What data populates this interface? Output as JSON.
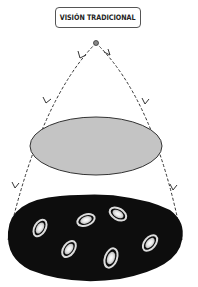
{
  "title": "VISIÓN TRADICIONAL",
  "diagram": {
    "apex_point": {
      "x": 96,
      "y": 43
    },
    "upper_ellipse": {
      "cx": 96,
      "cy": 146,
      "rx": 66,
      "ry": 29,
      "fill": "#c4c4c4"
    },
    "lower_ellipse": {
      "cx": 95,
      "cy": 238,
      "rx": 88,
      "ry": 45,
      "fill": "#0d0d0d"
    },
    "galaxies": [
      {
        "x": 40,
        "y": 228,
        "angle": -60
      },
      {
        "x": 86,
        "y": 220,
        "angle": -20
      },
      {
        "x": 118,
        "y": 214,
        "angle": 30
      },
      {
        "x": 69,
        "y": 249,
        "angle": -55
      },
      {
        "x": 111,
        "y": 258,
        "angle": -70
      },
      {
        "x": 150,
        "y": 243,
        "angle": -50
      }
    ]
  }
}
